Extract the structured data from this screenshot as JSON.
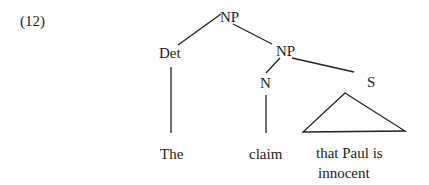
{
  "example_number": "(12)",
  "tree": {
    "root": {
      "label": "NP"
    },
    "det": {
      "label": "Det",
      "leaf": "The"
    },
    "np2": {
      "label": "NP"
    },
    "n": {
      "label": "N",
      "leaf": "claim"
    },
    "s": {
      "label": "S",
      "leaf_line1": "that Paul is",
      "leaf_line2": "innocent",
      "triangle": true
    }
  },
  "colors": {
    "ink": "#222222",
    "background": "#ffffff"
  }
}
